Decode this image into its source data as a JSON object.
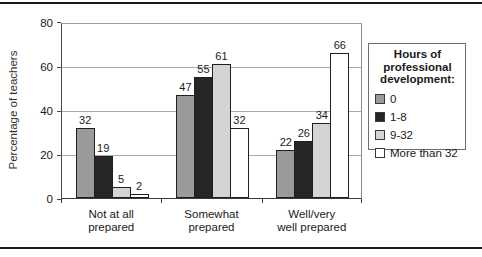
{
  "chart_data": {
    "type": "bar",
    "title": "",
    "ylabel": "Percentage of teachers",
    "xlabel": "",
    "ylim": [
      0,
      80
    ],
    "yticks": [
      0,
      20,
      40,
      60,
      80
    ],
    "grid": true,
    "categories": [
      "Not at all\nprepared",
      "Somewhat\nprepared",
      "Well/very\nwell prepared"
    ],
    "series": [
      {
        "name": "0",
        "color": "#9a9a9a",
        "values": [
          32,
          47,
          22
        ]
      },
      {
        "name": "1-8",
        "color": "#262626",
        "values": [
          19,
          55,
          26
        ]
      },
      {
        "name": "9-32",
        "color": "#d4d4d4",
        "values": [
          5,
          61,
          34
        ]
      },
      {
        "name": "More than 32",
        "color": "#ffffff",
        "values": [
          2,
          32,
          66
        ]
      }
    ],
    "legend": {
      "title": "Hours of\nprofessional\ndevelopment:",
      "position": "right"
    },
    "value_labels_shown": true
  },
  "colors": {
    "rule": "#1a1a1a",
    "gridline": "#ababab",
    "axis": "#3a3a3a",
    "frame": "#8c8c8c"
  }
}
